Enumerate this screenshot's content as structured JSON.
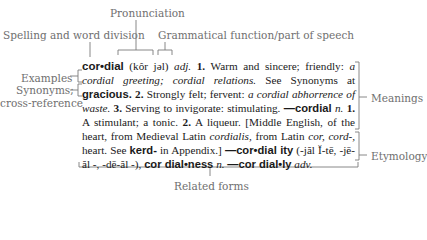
{
  "diagram": {
    "callouts": {
      "pronunciation": "Pronunciation",
      "spelling": "Spelling and word division",
      "grammatical": "Grammatical function/part of speech",
      "examples": "Examples",
      "synonyms_line1": "Synonyms;",
      "synonyms_line2": "cross-reference",
      "meanings": "Meanings",
      "etymology": "Etymology",
      "related_forms": "Related forms"
    },
    "entry": {
      "headword": "cor•dial",
      "pronunciation": "(kôr jəl)",
      "pos": "adj.",
      "sense1_num": "1.",
      "sense1_text": "Warm and sincere; friendly:",
      "sense1_example": "a cordial greeting; cordial relations.",
      "sense1_see": "See Synonyms at",
      "synonym_ref": "gracious.",
      "sense2_num": "2.",
      "sense2_text": "Strongly felt; fervent:",
      "sense2_example": "a cordial abhorrence of waste.",
      "sense3_num": "3.",
      "sense3_text": "Serving to invigorate: stimulating.",
      "noun_form": "—cordial",
      "noun_pos": "n.",
      "noun1_num": "1.",
      "noun1_text": "A stimulant; a tonic.",
      "noun2_num": "2.",
      "noun2_text": "A liqueur.",
      "etym_open": "[Middle English, of the heart, from Medieval Latin",
      "etym_cordialis": "cordialis,",
      "etym_from": "from Latin",
      "etym_cor": "cor, cord-,",
      "etym_heart": "heart. See",
      "etym_root": "kerd-",
      "etym_close": "in Appendix.]",
      "rel1": "—cor•dial ity",
      "rel1_pron": "(-jăl Ĭ-tē, -jē-ăl -, -dē-ăl -),",
      "rel2": "cor dial•ness",
      "rel2_pos": "n.",
      "rel3": "—cor dial•ly",
      "rel3_pos": "adv."
    }
  }
}
